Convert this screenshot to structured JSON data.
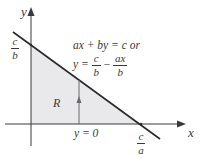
{
  "diagram": {
    "type": "region-under-line",
    "axes": {
      "x_label": "x",
      "y_label": "y"
    },
    "y_intercept_label": {
      "numerator": "c",
      "denominator": "b"
    },
    "x_intercept_label": {
      "numerator": "c",
      "denominator": "a"
    },
    "line_equation": {
      "line1": "ax + by = c or",
      "line2_lhs": "y =",
      "line2_term1": {
        "numerator": "c",
        "denominator": "b"
      },
      "line2_op": "−",
      "line2_term2": {
        "numerator": "ax",
        "denominator": "b"
      }
    },
    "region_label": "R",
    "bottom_boundary_label": "y = 0",
    "colors": {
      "region_fill": "#e9e9ec",
      "line": "#2a2a2a",
      "axis": "#3a3a3a",
      "arrow": "#6a6a6a"
    }
  }
}
